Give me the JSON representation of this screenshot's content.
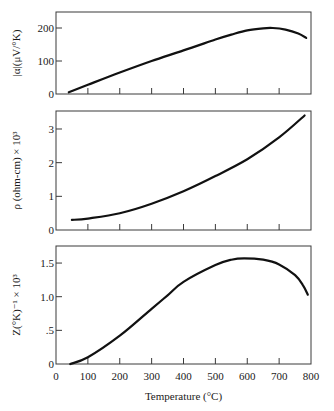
{
  "chart_data": [
    {
      "type": "line",
      "panel": "top",
      "ylabel": "|α|(μV/°K)",
      "xlabel": "",
      "xlim": [
        0,
        800
      ],
      "ylim": [
        0,
        245
      ],
      "yticks": [
        0,
        100,
        200
      ],
      "ytick_labels": [
        "0",
        "100",
        "200"
      ],
      "xticks": [
        100,
        200,
        300,
        400,
        500,
        600,
        700
      ],
      "grid": false,
      "series": [
        {
          "name": "Seebeck coefficient",
          "x": [
            40,
            100,
            200,
            300,
            400,
            500,
            550,
            600,
            650,
            680,
            720,
            760,
            785
          ],
          "y": [
            5,
            28,
            65,
            100,
            132,
            165,
            180,
            193,
            199,
            200,
            195,
            183,
            170
          ]
        }
      ]
    },
    {
      "type": "line",
      "panel": "middle",
      "ylabel": "ρ (ohm-cm) × 10³",
      "xlabel": "",
      "xlim": [
        0,
        800
      ],
      "ylim": [
        0,
        3.5
      ],
      "yticks": [
        0,
        1,
        2,
        3
      ],
      "ytick_labels": [
        "0",
        "1",
        "2",
        "3"
      ],
      "xticks": [
        100,
        200,
        300,
        400,
        500,
        600,
        700
      ],
      "grid": false,
      "series": [
        {
          "name": "Electrical resistivity",
          "x": [
            50,
            100,
            200,
            300,
            400,
            500,
            600,
            700,
            780
          ],
          "y": [
            0.3,
            0.34,
            0.5,
            0.78,
            1.15,
            1.6,
            2.1,
            2.75,
            3.4
          ]
        }
      ]
    },
    {
      "type": "line",
      "panel": "bottom",
      "ylabel": "Z(°K)⁻¹ × 10³",
      "xlabel": "Temperature (°C)",
      "xlim": [
        0,
        800
      ],
      "ylim": [
        0,
        1.75
      ],
      "yticks": [
        0,
        0.5,
        1.0,
        1.5
      ],
      "ytick_labels": [
        "0",
        ".5",
        "1.0",
        "1.5"
      ],
      "xticks": [
        0,
        100,
        200,
        300,
        400,
        500,
        600,
        700,
        800
      ],
      "xtick_labels": [
        "0",
        "100",
        "200",
        "300",
        "400",
        "500",
        "600",
        "700",
        "800"
      ],
      "grid": false,
      "series": [
        {
          "name": "Figure of merit",
          "x": [
            45,
            100,
            200,
            300,
            350,
            400,
            500,
            550,
            590,
            650,
            700,
            750,
            775,
            790
          ],
          "y": [
            0,
            0.1,
            0.42,
            0.82,
            1.02,
            1.22,
            1.47,
            1.55,
            1.57,
            1.55,
            1.48,
            1.32,
            1.17,
            1.03
          ]
        }
      ]
    }
  ],
  "layout": {
    "x_px": {
      "origin": 56,
      "end": 311,
      "min": 0,
      "max": 800
    },
    "panels": [
      {
        "top": 12,
        "bottom": 94,
        "y_px0": 94,
        "y_scale": 0.33,
        "label_cx": 20
      },
      {
        "top": 111,
        "bottom": 230,
        "y_px0": 230,
        "y_scale": 33.67,
        "label_cx": 20
      },
      {
        "top": 246,
        "bottom": 364,
        "y_px0": 364,
        "y_scale": 67.3,
        "label_cx": 20
      }
    ],
    "colors": {
      "curve": "#111111",
      "axis": "#3a3a3a",
      "background": "#ffffff"
    }
  }
}
